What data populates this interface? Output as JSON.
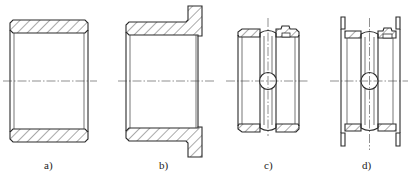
{
  "figure": {
    "colors": {
      "line": "#2a2a2a",
      "background": "#ffffff"
    },
    "panels": [
      {
        "id": "a",
        "label": "a)",
        "type": "plain-bushing"
      },
      {
        "id": "b",
        "label": "b)",
        "type": "flanged-bushing"
      },
      {
        "id": "c",
        "label": "c)",
        "type": "bushing-with-oil-groove-and-hole"
      },
      {
        "id": "d",
        "label": "d)",
        "type": "double-flanged-bushing-with-oil-groove-and-hole"
      }
    ]
  }
}
